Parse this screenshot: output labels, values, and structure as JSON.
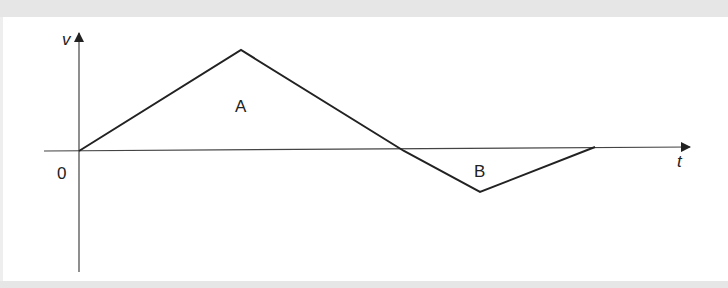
{
  "diagram": {
    "type": "velocity-time graph",
    "axes": {
      "y_label": "v",
      "x_label": "t",
      "origin_label": "0"
    },
    "regions": [
      {
        "label": "A",
        "description": "triangle above t-axis"
      },
      {
        "label": "B",
        "description": "triangle below t-axis"
      }
    ],
    "polyline_points": [
      [
        79,
        151
      ],
      [
        241,
        50
      ],
      [
        404,
        151
      ],
      [
        480,
        192
      ],
      [
        595,
        147
      ]
    ],
    "colors": {
      "line": "#222222",
      "axis": "#444444",
      "border": "#e6e6e6"
    }
  }
}
